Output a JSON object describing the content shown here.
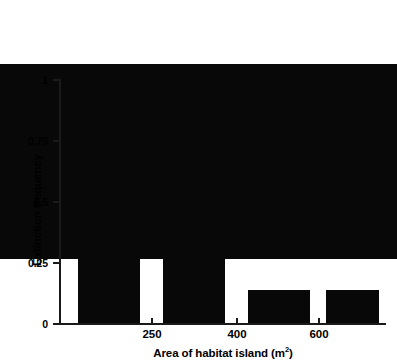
{
  "chart_data": {
    "type": "bar",
    "title": "",
    "xlabel": "Area of habitat island (m2)",
    "xlabel_base": "Area of habitat island (m",
    "xlabel_sup": "2",
    "xlabel_tail": ")",
    "ylabel": "Extinction frequency",
    "categories": [
      "",
      "",
      "",
      ""
    ],
    "values": [
      0.8,
      0.7,
      0.5,
      0.135
    ],
    "ylim": [
      0,
      1
    ],
    "yticks": [
      0,
      0.25,
      0.5,
      0.75,
      1
    ],
    "ytick_labels": [
      "0",
      "0.25",
      "0.5",
      "0.75",
      "1"
    ],
    "xtick_labels": [
      "250",
      "400",
      "600"
    ],
    "grid": false,
    "legend": "none",
    "bar_color": "#080808",
    "axis_color": "#1a1a1a",
    "background": "#ffffff"
  },
  "axes": {
    "y_tick_0": "0",
    "y_tick_1": "0.25",
    "y_tick_2": "0.5",
    "y_tick_3": "0.75",
    "y_tick_4": "1",
    "x_tick_0": "250",
    "x_tick_1": "400",
    "x_tick_2": "600"
  }
}
